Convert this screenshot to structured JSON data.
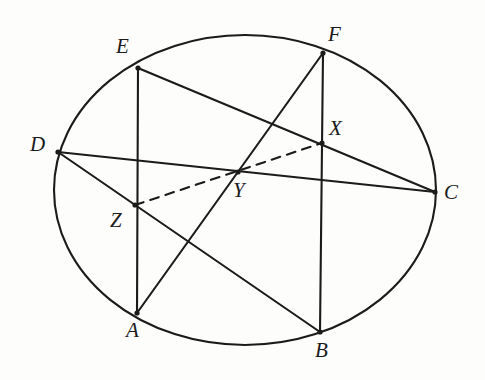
{
  "figure": {
    "type": "geometry-diagram",
    "canvas": {
      "width": 485,
      "height": 380
    },
    "background_color": "#fdfdfb",
    "ink_color": "#1b1b1b",
    "stroke_width": 2.1,
    "ellipse": {
      "name": "circumscribed-ellipse",
      "cx": 245,
      "cy": 190,
      "rx": 191,
      "ry": 155,
      "style": "solid"
    },
    "points": [
      {
        "id": "A",
        "label": "A",
        "x": 137,
        "y": 313,
        "on_ellipse": true,
        "label_x": 126,
        "label_y": 320,
        "dot": true
      },
      {
        "id": "B",
        "label": "B",
        "x": 320,
        "y": 332,
        "on_ellipse": true,
        "label_x": 315,
        "label_y": 340,
        "dot": true
      },
      {
        "id": "C",
        "label": "C",
        "x": 435,
        "y": 192,
        "on_ellipse": true,
        "label_x": 444,
        "label_y": 182,
        "dot": true
      },
      {
        "id": "D",
        "label": "D",
        "x": 58,
        "y": 152,
        "on_ellipse": true,
        "label_x": 30,
        "label_y": 134,
        "dot": true
      },
      {
        "id": "E",
        "label": "E",
        "x": 138,
        "y": 68,
        "on_ellipse": true,
        "label_x": 116,
        "label_y": 36,
        "dot": true
      },
      {
        "id": "F",
        "label": "F",
        "x": 323,
        "y": 53,
        "on_ellipse": true,
        "label_x": 328,
        "label_y": 24,
        "dot": true
      },
      {
        "id": "X",
        "label": "X",
        "x": 322,
        "y": 143,
        "on_ellipse": false,
        "label_x": 329,
        "label_y": 118,
        "dot": true
      },
      {
        "id": "Y",
        "label": "Y",
        "x": 238,
        "y": 172,
        "on_ellipse": false,
        "label_x": 233,
        "label_y": 180,
        "dot": true
      },
      {
        "id": "Z",
        "label": "Z",
        "x": 135,
        "y": 205,
        "on_ellipse": false,
        "label_x": 110,
        "label_y": 210,
        "dot": true
      }
    ],
    "segments": [
      {
        "id": "EA",
        "name": "chord-E-A",
        "from": "E",
        "to": "A",
        "style": "solid",
        "passes_through": [
          "Z"
        ]
      },
      {
        "id": "FB",
        "name": "chord-F-B",
        "from": "F",
        "to": "B",
        "style": "solid",
        "passes_through": [
          "X"
        ]
      },
      {
        "id": "DC",
        "name": "chord-D-C",
        "from": "D",
        "to": "C",
        "style": "solid",
        "passes_through": [
          "Y"
        ]
      },
      {
        "id": "EC",
        "name": "chord-E-C",
        "from": "E",
        "to": "C",
        "style": "solid",
        "passes_through": [
          "X"
        ]
      },
      {
        "id": "DB",
        "name": "chord-D-B",
        "from": "D",
        "to": "B",
        "style": "solid",
        "passes_through": [
          "Z"
        ]
      },
      {
        "id": "AF",
        "name": "chord-A-F",
        "from": "A",
        "to": "F",
        "style": "solid",
        "passes_through": [
          "Y"
        ]
      },
      {
        "id": "ZX",
        "name": "dashed-line-Z-X",
        "from": "Z",
        "to": "X",
        "style": "dashed",
        "dash_pattern": "9 7",
        "passes_through": [
          "Y"
        ]
      }
    ]
  }
}
